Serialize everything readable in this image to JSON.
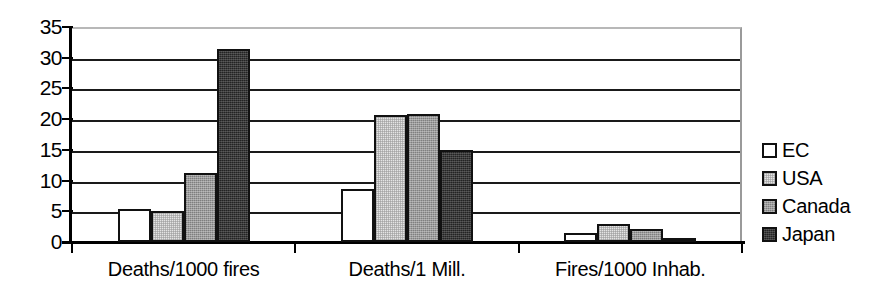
{
  "chart_data": {
    "type": "bar",
    "title": "",
    "subtitle": "",
    "xlabel": "",
    "ylabel": "",
    "categories": [
      "Deaths/1000 fires",
      "Deaths/1 Mill.",
      "Fires/1000 Inhab."
    ],
    "series": [
      {
        "name": "EC",
        "color": "#ffffff",
        "values": [
          5.3,
          8.7,
          1.4
        ]
      },
      {
        "name": "USA",
        "color": "#e4e4e4",
        "values": [
          5.0,
          20.6,
          2.9
        ]
      },
      {
        "name": "Canada",
        "color": "#9b9b9b",
        "values": [
          11.2,
          20.9,
          2.2
        ]
      },
      {
        "name": "Japan",
        "color": "#232323",
        "values": [
          31.4,
          14.9,
          0.2
        ]
      }
    ],
    "ylim": [
      0,
      35
    ],
    "ytick_values": [
      0,
      5,
      10,
      15,
      20,
      25,
      30,
      35
    ],
    "ytick_labels": [
      "0",
      "5",
      "10",
      "15",
      "20",
      "25",
      "30",
      "35"
    ],
    "grid": true,
    "grid_axis": "y",
    "legend_position": "right",
    "bar_gap_within_group": 0
  },
  "legend": {
    "items": [
      {
        "label": "EC"
      },
      {
        "label": "USA"
      },
      {
        "label": "Canada"
      },
      {
        "label": "Japan"
      }
    ]
  },
  "axes": {
    "y_ticks": [
      {
        "label": "35"
      },
      {
        "label": "30"
      },
      {
        "label": "25"
      },
      {
        "label": "20"
      },
      {
        "label": "15"
      },
      {
        "label": "10"
      },
      {
        "label": "5"
      },
      {
        "label": "0"
      }
    ],
    "x_ticks": [
      {
        "label": "Deaths/1000 fires"
      },
      {
        "label": "Deaths/1 Mill."
      },
      {
        "label": "Fires/1000 Inhab."
      }
    ]
  }
}
